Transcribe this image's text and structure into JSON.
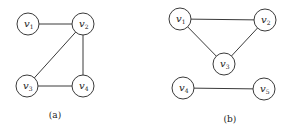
{
  "figure": {
    "graphs": [
      {
        "id": "a",
        "caption": "(a)",
        "caption_pos": [
          55,
          118
        ],
        "node_radius": 11,
        "nodes": [
          {
            "id": "v1",
            "base": "v",
            "sub": "1",
            "x": 28,
            "y": 24
          },
          {
            "id": "v2",
            "base": "v",
            "sub": "2",
            "x": 83,
            "y": 24
          },
          {
            "id": "v3",
            "base": "v",
            "sub": "3",
            "x": 27,
            "y": 86
          },
          {
            "id": "v4",
            "base": "v",
            "sub": "4",
            "x": 83,
            "y": 86
          }
        ],
        "edges": [
          [
            "v1",
            "v2"
          ],
          [
            "v2",
            "v3"
          ],
          [
            "v2",
            "v4"
          ],
          [
            "v3",
            "v4"
          ]
        ]
      },
      {
        "id": "b",
        "caption": "(b)",
        "caption_pos": [
          230,
          122
        ],
        "node_radius": 11,
        "nodes": [
          {
            "id": "v1",
            "base": "v",
            "sub": "1",
            "x": 180,
            "y": 19
          },
          {
            "id": "v2",
            "base": "v",
            "sub": "2",
            "x": 265,
            "y": 20
          },
          {
            "id": "v3",
            "base": "v",
            "sub": "3",
            "x": 224,
            "y": 64
          },
          {
            "id": "v4",
            "base": "v",
            "sub": "4",
            "x": 183,
            "y": 88
          },
          {
            "id": "v5",
            "base": "v",
            "sub": "5",
            "x": 264,
            "y": 89
          }
        ],
        "edges": [
          [
            "v1",
            "v2"
          ],
          [
            "v1",
            "v3"
          ],
          [
            "v2",
            "v3"
          ],
          [
            "v4",
            "v5"
          ]
        ]
      }
    ]
  }
}
